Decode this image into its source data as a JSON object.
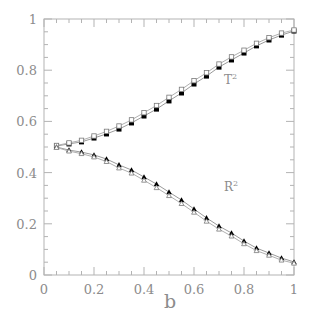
{
  "chart_data": {
    "type": "line",
    "title": "",
    "xlabel": "b",
    "ylabel": "",
    "xlim": [
      0,
      1
    ],
    "ylim": [
      0,
      1
    ],
    "grid": false,
    "legend": "none (inline curve labels)",
    "x_ticks": [
      "0",
      "0.2",
      "0.4",
      "0.6",
      "0.8",
      "1"
    ],
    "y_ticks": [
      "0",
      "0.2",
      "0.4",
      "0.6",
      "0.8",
      "1"
    ],
    "x": [
      0.05,
      0.1,
      0.15,
      0.2,
      0.25,
      0.3,
      0.35,
      0.4,
      0.45,
      0.5,
      0.55,
      0.6,
      0.65,
      0.7,
      0.75,
      0.8,
      0.85,
      0.9,
      0.95,
      1.0
    ],
    "series": [
      {
        "name": "T² (filled squares)",
        "marker": "filled-square",
        "values": [
          0.504,
          0.512,
          0.52,
          0.535,
          0.551,
          0.57,
          0.594,
          0.621,
          0.648,
          0.68,
          0.711,
          0.746,
          0.777,
          0.812,
          0.84,
          0.867,
          0.895,
          0.918,
          0.937,
          0.953
        ]
      },
      {
        "name": "T² (open squares)",
        "marker": "open-square",
        "values": [
          0.506,
          0.516,
          0.526,
          0.543,
          0.561,
          0.582,
          0.606,
          0.634,
          0.662,
          0.694,
          0.725,
          0.759,
          0.79,
          0.824,
          0.852,
          0.878,
          0.905,
          0.927,
          0.945,
          0.957
        ]
      },
      {
        "name": "R² (filled triangles)",
        "marker": "filled-triangle",
        "values": [
          0.5,
          0.488,
          0.48,
          0.469,
          0.453,
          0.43,
          0.41,
          0.383,
          0.355,
          0.324,
          0.293,
          0.258,
          0.223,
          0.191,
          0.164,
          0.133,
          0.105,
          0.086,
          0.066,
          0.051
        ]
      },
      {
        "name": "R² (open triangles)",
        "marker": "open-triangle",
        "values": [
          0.498,
          0.484,
          0.474,
          0.461,
          0.443,
          0.418,
          0.398,
          0.37,
          0.341,
          0.31,
          0.279,
          0.245,
          0.21,
          0.179,
          0.152,
          0.122,
          0.095,
          0.077,
          0.058,
          0.046
        ]
      }
    ],
    "annotations": [
      {
        "text": "T",
        "sup": "2",
        "x": 0.72,
        "y": 0.745
      },
      {
        "text": "R",
        "sup": "2",
        "x": 0.72,
        "y": 0.33
      }
    ]
  },
  "colors": {
    "axis": "#b3b3b3",
    "text": "#8c8c8c",
    "marker": "#000000",
    "line": "#9a9a9a"
  }
}
